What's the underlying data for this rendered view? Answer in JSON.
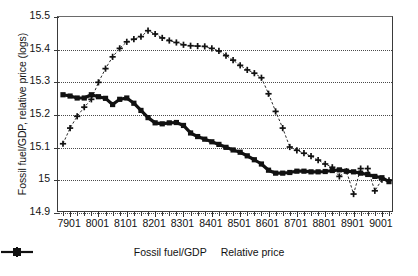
{
  "chart_data": {
    "type": "line",
    "title": "",
    "xlabel": "",
    "ylabel": "Fossil fuel/GDP, relative price (logs)",
    "ylim": [
      14.9,
      15.5
    ],
    "yticks": [
      "14.9",
      "15",
      "15.1",
      "15.2",
      "15.3",
      "15.4",
      "15.5"
    ],
    "ytick_values": [
      14.9,
      15.0,
      15.1,
      15.2,
      15.3,
      15.4,
      15.5
    ],
    "grid": "horizontal-dotted",
    "legend_position": "bottom-center",
    "x_tick_labels": [
      "7901",
      "8001",
      "8101",
      "8201",
      "8301",
      "8401",
      "8501",
      "8601",
      "8701",
      "8801",
      "8901",
      "9001"
    ],
    "x_tick_values": [
      7901,
      8001,
      8101,
      8201,
      8301,
      8401,
      8501,
      8601,
      8701,
      8801,
      8901,
      9001
    ],
    "x": [
      7804,
      7901,
      7902,
      7903,
      7904,
      8001,
      8002,
      8003,
      8004,
      8101,
      8102,
      8103,
      8104,
      8201,
      8202,
      8203,
      8204,
      8301,
      8302,
      8303,
      8304,
      8401,
      8402,
      8403,
      8404,
      8501,
      8502,
      8503,
      8504,
      8601,
      8602,
      8603,
      8604,
      8701,
      8702,
      8703,
      8704,
      8801,
      8802,
      8803,
      8804,
      8901,
      8902,
      8903,
      8904,
      9001,
      9002
    ],
    "series": [
      {
        "name": "Fossil fuel/GDP",
        "marker": "square",
        "linestyle": "solid",
        "color": "#111111",
        "values": [
          15.262,
          15.258,
          15.252,
          15.252,
          15.262,
          15.256,
          15.251,
          15.232,
          15.248,
          15.252,
          15.236,
          15.214,
          15.192,
          15.176,
          15.173,
          15.176,
          15.177,
          15.168,
          15.145,
          15.134,
          15.126,
          15.118,
          15.11,
          15.101,
          15.093,
          15.086,
          15.075,
          15.063,
          15.05,
          15.031,
          15.022,
          15.022,
          15.024,
          15.028,
          15.028,
          15.026,
          15.026,
          15.027,
          15.03,
          15.032,
          15.028,
          15.026,
          15.022,
          15.018,
          15.012,
          15.008,
          14.996
        ]
      },
      {
        "name": "Relative price",
        "marker": "plus",
        "linestyle": "dashed",
        "color": "#111111",
        "values": [
          15.112,
          15.16,
          15.196,
          15.224,
          15.248,
          15.3,
          15.342,
          15.378,
          15.404,
          15.424,
          15.432,
          15.44,
          15.458,
          15.448,
          15.436,
          15.428,
          15.422,
          15.415,
          15.412,
          15.411,
          15.41,
          15.404,
          15.396,
          15.382,
          15.368,
          15.352,
          15.338,
          15.328,
          15.314,
          15.265,
          15.211,
          15.16,
          15.102,
          15.092,
          15.083,
          15.074,
          15.062,
          15.05,
          15.04,
          15.012,
          15.028,
          14.958,
          15.036,
          15.036,
          14.968,
          15.002,
          15.0
        ]
      }
    ]
  },
  "legend": {
    "items": [
      {
        "label": "Fossil fuel/GDP",
        "marker": "square-marker-icon"
      },
      {
        "label": "Relative price",
        "marker": "plus-marker-icon"
      }
    ]
  }
}
